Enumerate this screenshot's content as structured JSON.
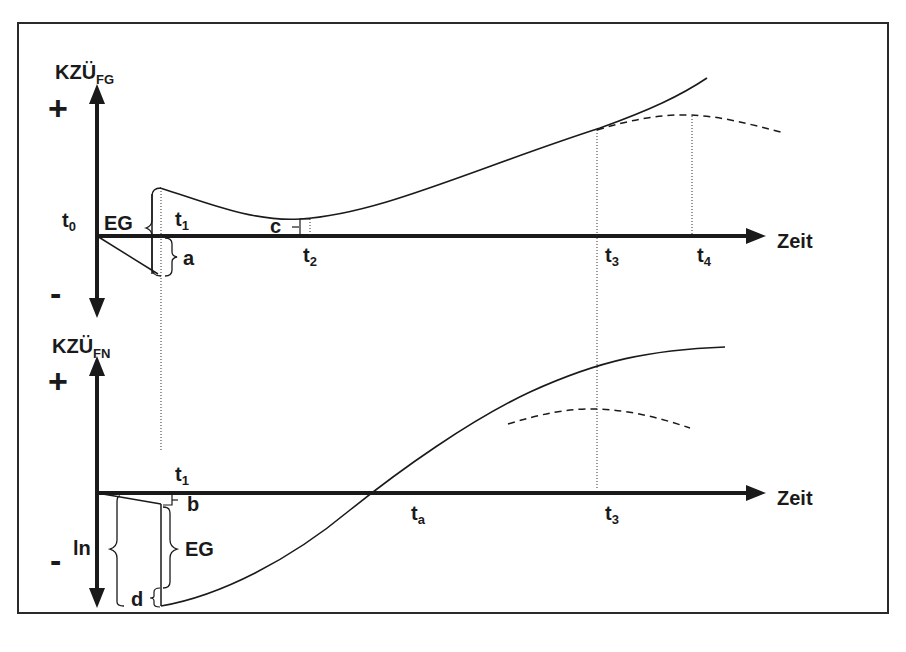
{
  "diagram": {
    "type": "cash-flow-curve-comparison",
    "colors": {
      "ink": "#1a1a1a",
      "background": "#ffffff",
      "frame": "#2a2a2a"
    },
    "top_panel": {
      "y_axis_label": "KZÜ",
      "y_axis_subscript": "FG",
      "plus_sign": "+",
      "minus_sign": "-",
      "x_axis_label": "Zeit",
      "origin_label": "t",
      "origin_sub": "0",
      "time_marks": [
        {
          "base": "t",
          "sub": "1"
        },
        {
          "base": "t",
          "sub": "2"
        },
        {
          "base": "t",
          "sub": "3"
        },
        {
          "base": "t",
          "sub": "4"
        }
      ],
      "brace_labels": {
        "eg": "EG",
        "a": "a",
        "c": "c"
      }
    },
    "bottom_panel": {
      "y_axis_label": "KZÜ",
      "y_axis_subscript": "FN",
      "plus_sign": "+",
      "minus_sign": "-",
      "x_axis_label": "Zeit",
      "time_marks": [
        {
          "base": "t",
          "sub": "1"
        },
        {
          "base": "t",
          "sub": "a"
        },
        {
          "base": "t",
          "sub": "3"
        }
      ],
      "brace_labels": {
        "ln": "ln",
        "b": "b",
        "eg": "EG",
        "d": "d"
      }
    }
  }
}
